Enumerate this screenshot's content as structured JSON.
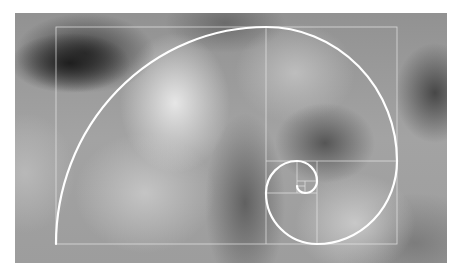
{
  "figure": {
    "background": "blurred grayscale photograph",
    "line_color": "#ffffff",
    "grid_color": "#e6e6e6"
  },
  "diagram": {
    "type": "fibonacci-spiral",
    "outer_rect": {
      "x": 56,
      "y": 27,
      "w": 341,
      "h": 217
    },
    "squares": [
      {
        "name": "square-1",
        "x": 56,
        "y": 27,
        "w": 210,
        "h": 217
      },
      {
        "name": "square-2",
        "x": 266,
        "y": 27,
        "w": 131,
        "h": 134
      },
      {
        "name": "square-3",
        "x": 317,
        "y": 161,
        "w": 80,
        "h": 83
      },
      {
        "name": "square-4",
        "x": 266,
        "y": 193,
        "w": 51,
        "h": 51
      },
      {
        "name": "square-5",
        "x": 266,
        "y": 161,
        "w": 31,
        "h": 32
      },
      {
        "name": "square-6",
        "x": 297,
        "y": 161,
        "w": 20,
        "h": 20
      },
      {
        "name": "square-7",
        "x": 305,
        "y": 181,
        "w": 12,
        "h": 12
      }
    ]
  }
}
